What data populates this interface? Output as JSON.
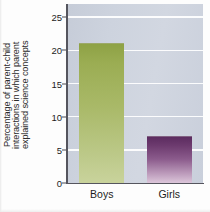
{
  "chart_data": {
    "type": "bar",
    "title": "",
    "xlabel": "",
    "ylabel_lines": [
      "Percentage of parent-child",
      "interactions in which parent",
      "explained science concepts"
    ],
    "ylabel": "Percentage of parent-child interactions in which parent explained science concepts",
    "categories": [
      "Boys",
      "Girls"
    ],
    "values": [
      21,
      7
    ],
    "ylim": [
      0,
      27
    ],
    "yticks": [
      0,
      5,
      10,
      15,
      20,
      25
    ],
    "ytick_labels": [
      "0",
      "5",
      "10",
      "15",
      "20",
      "25"
    ],
    "grid": true,
    "legend": "none",
    "series": [
      {
        "name": "Percentage of parent-child interactions in which parent explained science concepts",
        "values": [
          21,
          7
        ]
      }
    ],
    "bar_colors": [
      "#a9b968",
      "#7a4a7c"
    ],
    "plot_background": "#ccd2dd",
    "gridline_color": "#ffffff",
    "axis_color": "#55555e"
  }
}
